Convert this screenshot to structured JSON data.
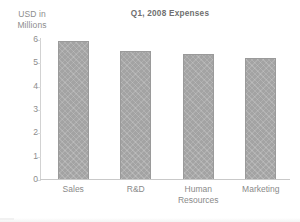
{
  "chart_data": {
    "type": "bar",
    "title": "Q1, 2008  Expenses",
    "xlabel": "",
    "ylabel": "USD in Millions",
    "ylabel_lines": [
      "USD in",
      "Millions"
    ],
    "categories": [
      "Sales",
      "R&D",
      "Human Resources",
      "Marketing"
    ],
    "category_lines": [
      [
        "Sales"
      ],
      [
        "R&D"
      ],
      [
        "Human",
        "Resources"
      ],
      [
        "Marketing"
      ]
    ],
    "values": [
      5.9,
      5.5,
      5.35,
      5.2
    ],
    "ylim": [
      0,
      6
    ],
    "ytick_labels": [
      "6",
      "5",
      "4",
      "3",
      "2",
      "1",
      "0"
    ],
    "ytick_values": [
      6,
      5,
      4,
      3,
      2,
      1,
      0
    ],
    "grid": false,
    "legend": false,
    "bar_color": "#a3a3a3",
    "bar_border_color": "#9a9a9a",
    "axis_color": "#cfcfcf",
    "text_color": "#8a8a8a",
    "title_color": "#6f6f6f",
    "background": "#ffffff"
  }
}
